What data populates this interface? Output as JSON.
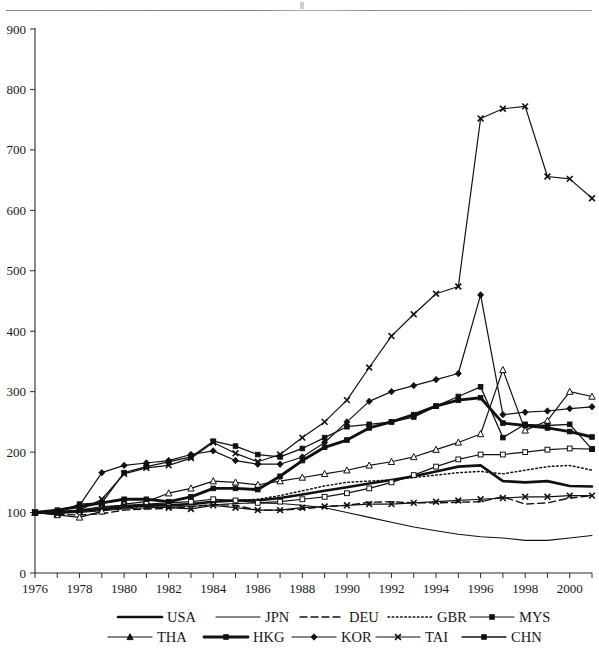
{
  "figure": {
    "background": "#ffffff",
    "ink": "#111114",
    "top_rule": true
  },
  "chart_data": {
    "type": "line",
    "title": "",
    "subtitle": "",
    "xlabel": "",
    "ylabel": "",
    "xlim": [
      1976,
      2001
    ],
    "ylim": [
      0,
      900
    ],
    "ytick_step": 100,
    "yticks": [
      0,
      100,
      200,
      300,
      400,
      500,
      600,
      700,
      800,
      900
    ],
    "ytick_labels": [
      "0",
      "100",
      "200",
      "300",
      "400",
      "500",
      "600",
      "700",
      "800",
      "900"
    ],
    "x": [
      1976,
      1977,
      1978,
      1979,
      1980,
      1981,
      1982,
      1983,
      1984,
      1985,
      1986,
      1987,
      1988,
      1989,
      1990,
      1991,
      1992,
      1993,
      1994,
      1995,
      1996,
      1997,
      1998,
      1999,
      2000,
      2001
    ],
    "xtick_years": [
      1976,
      1977,
      1978,
      1979,
      1980,
      1981,
      1982,
      1983,
      1984,
      1985,
      1986,
      1987,
      1988,
      1989,
      1990,
      1991,
      1992,
      1993,
      1994,
      1995,
      1996,
      1997,
      1998,
      1999,
      2000,
      2001
    ],
    "xtick_labels_shown": [
      "1976",
      "1978",
      "1980",
      "1982",
      "1984",
      "1986",
      "1988",
      "1990",
      "1992",
      "1994",
      "1996",
      "1998",
      "2000"
    ],
    "grid": false,
    "legend_position": "bottom",
    "series": [
      {
        "name": "USA",
        "style": "solid",
        "width": 2.6,
        "marker": "none",
        "values": [
          100,
          101,
          103,
          106,
          109,
          112,
          112,
          114,
          118,
          120,
          120,
          124,
          130,
          136,
          142,
          148,
          154,
          160,
          168,
          176,
          178,
          152,
          150,
          152,
          144,
          143
        ]
      },
      {
        "name": "JPN",
        "style": "solid",
        "width": 1.1,
        "marker": "none",
        "values": [
          100,
          99,
          100,
          103,
          106,
          108,
          109,
          110,
          113,
          115,
          116,
          115,
          112,
          108,
          100,
          92,
          84,
          76,
          70,
          64,
          60,
          58,
          54,
          54,
          58,
          62
        ]
      },
      {
        "name": "DEU",
        "style": "dashed",
        "width": 1.4,
        "marker": "none",
        "values": [
          100,
          97,
          96,
          98,
          104,
          106,
          107,
          110,
          113,
          112,
          104,
          104,
          106,
          110,
          112,
          117,
          118,
          116,
          116,
          117,
          118,
          126,
          114,
          116,
          124,
          128
        ]
      },
      {
        "name": "GBR",
        "style": "dotted",
        "width": 1.5,
        "marker": "none",
        "values": [
          100,
          100,
          101,
          104,
          108,
          110,
          112,
          114,
          118,
          120,
          122,
          128,
          136,
          144,
          150,
          152,
          154,
          158,
          162,
          166,
          168,
          164,
          170,
          176,
          178,
          170
        ]
      },
      {
        "name": "MYS",
        "style": "solid",
        "width": 1.2,
        "marker": "square-open",
        "values": [
          100,
          100,
          104,
          110,
          112,
          114,
          116,
          118,
          122,
          120,
          116,
          118,
          122,
          126,
          132,
          140,
          150,
          162,
          176,
          188,
          196,
          196,
          200,
          204,
          206,
          205
        ]
      },
      {
        "name": "THA",
        "style": "solid",
        "width": 1.2,
        "marker": "triangle-open",
        "values": [
          100,
          96,
          92,
          102,
          114,
          118,
          132,
          140,
          152,
          150,
          146,
          152,
          158,
          164,
          170,
          178,
          184,
          192,
          204,
          216,
          230,
          336,
          236,
          252,
          300,
          292
        ]
      },
      {
        "name": "HKG",
        "style": "solid",
        "width": 2.9,
        "marker": "square",
        "values": [
          100,
          104,
          110,
          116,
          122,
          122,
          118,
          126,
          140,
          140,
          138,
          160,
          186,
          208,
          220,
          240,
          250,
          262,
          276,
          286,
          290,
          248,
          244,
          240,
          234,
          225
        ]
      },
      {
        "name": "KOR",
        "style": "solid",
        "width": 1.2,
        "marker": "diamond",
        "values": [
          100,
          102,
          112,
          166,
          178,
          182,
          186,
          196,
          202,
          186,
          180,
          180,
          192,
          216,
          250,
          284,
          300,
          310,
          320,
          330,
          460,
          262,
          266,
          268,
          272,
          275
        ]
      },
      {
        "name": "TAI",
        "style": "solid",
        "width": 1.2,
        "marker": "x",
        "values": [
          100,
          98,
          102,
          108,
          112,
          110,
          108,
          106,
          112,
          108,
          104,
          104,
          108,
          110,
          112,
          114,
          114,
          116,
          118,
          120,
          122,
          124,
          126,
          126,
          128,
          128
        ]
      },
      {
        "name": "CHN",
        "style": "solid",
        "width": 1.3,
        "marker": "square",
        "values": [
          100,
          100,
          114,
          116,
          166,
          176,
          184,
          192,
          218,
          210,
          196,
          192,
          206,
          224,
          242,
          246,
          250,
          258,
          276,
          292,
          308,
          224,
          246,
          244,
          246,
          205
        ]
      }
    ],
    "highlight_series": {
      "name": "TAI",
      "note": "top trajectory",
      "values": [
        100,
        98,
        104,
        122,
        164,
        174,
        178,
        190,
        216,
        198,
        184,
        196,
        224,
        250,
        286,
        340,
        392,
        428,
        462,
        474,
        752,
        768,
        772,
        656,
        652,
        620
      ]
    }
  },
  "axes": {
    "y_axis_name": "value-axis",
    "x_axis_name": "year-axis"
  },
  "legend": {
    "rows": [
      [
        {
          "label": "USA",
          "style": "solid",
          "width": 2.6,
          "marker": "none"
        },
        {
          "label": "JPN",
          "style": "solid",
          "width": 1.1,
          "marker": "none"
        },
        {
          "label": "DEU",
          "style": "dashed",
          "width": 1.4,
          "marker": "none"
        },
        {
          "label": "GBR",
          "style": "dotted",
          "width": 1.5,
          "marker": "none"
        },
        {
          "label": "MYS",
          "style": "solid",
          "width": 1.2,
          "marker": "square"
        }
      ],
      [
        {
          "label": "THA",
          "style": "solid",
          "width": 1.2,
          "marker": "triangle"
        },
        {
          "label": "HKG",
          "style": "solid",
          "width": 2.9,
          "marker": "square"
        },
        {
          "label": "KOR",
          "style": "solid",
          "width": 1.2,
          "marker": "diamond"
        },
        {
          "label": "TAI",
          "style": "solid",
          "width": 1.2,
          "marker": "x"
        },
        {
          "label": "CHN",
          "style": "solid",
          "width": 1.3,
          "marker": "square"
        }
      ]
    ]
  }
}
